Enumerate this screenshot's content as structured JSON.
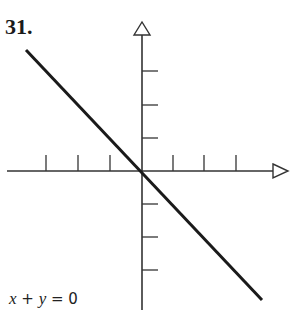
{
  "problem": {
    "number": "31."
  },
  "equation": {
    "x": "x",
    "op1": " + ",
    "y": "y",
    "rest": " = 0"
  },
  "graph": {
    "origin": [
      142,
      171
    ],
    "tick_spacing": 32,
    "x_ticks_left": 3,
    "x_ticks_right": 3,
    "y_ticks_up": 3,
    "y_ticks_down": 3,
    "line": {
      "from": [
        26,
        50
      ],
      "to": [
        262,
        300
      ],
      "color": "#1a1a1a",
      "slope": -1
    },
    "axis_color": "#333333"
  }
}
